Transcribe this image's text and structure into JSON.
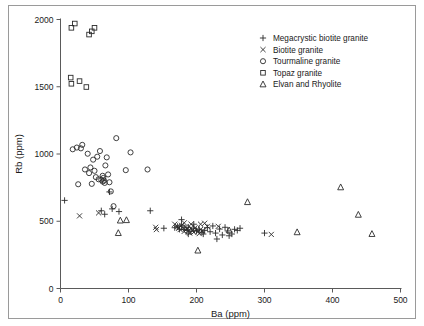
{
  "chart_data": {
    "type": "scatter",
    "title": "",
    "xlabel": "Ba (ppm)",
    "ylabel": "Rb (ppm)",
    "xlim": [
      0,
      500
    ],
    "ylim": [
      0,
      2000
    ],
    "xticks": [
      0,
      100,
      200,
      300,
      400,
      500
    ],
    "yticks": [
      0,
      500,
      1000,
      1500,
      2000
    ],
    "grid": false,
    "legend_position": "top-right",
    "series": [
      {
        "name": "Megacrystic biotite granite",
        "marker": "plus",
        "points": [
          [
            6,
            655
          ],
          [
            72,
            718
          ],
          [
            60,
            578
          ],
          [
            65,
            552
          ],
          [
            76,
            592
          ],
          [
            86,
            572
          ],
          [
            132,
            578
          ],
          [
            152,
            448
          ],
          [
            168,
            452
          ],
          [
            172,
            462
          ],
          [
            175,
            440
          ],
          [
            178,
            470
          ],
          [
            182,
            438
          ],
          [
            186,
            432
          ],
          [
            188,
            455
          ],
          [
            192,
            425
          ],
          [
            196,
            448
          ],
          [
            200,
            430
          ],
          [
            204,
            440
          ],
          [
            208,
            418
          ],
          [
            212,
            432
          ],
          [
            216,
            452
          ],
          [
            220,
            422
          ],
          [
            224,
            465
          ],
          [
            228,
            412
          ],
          [
            230,
            368
          ],
          [
            234,
            442
          ],
          [
            238,
            398
          ],
          [
            242,
            455
          ],
          [
            246,
            428
          ],
          [
            248,
            392
          ],
          [
            252,
            405
          ],
          [
            256,
            440
          ],
          [
            260,
            432
          ],
          [
            264,
            448
          ],
          [
            300,
            412
          ],
          [
            178,
            512
          ],
          [
            196,
            478
          ],
          [
            210,
            405
          ],
          [
            188,
            405
          ]
        ]
      },
      {
        "name": "Biotite granite",
        "marker": "x",
        "points": [
          [
            28,
            540
          ],
          [
            56,
            562
          ],
          [
            140,
            455
          ],
          [
            141,
            438
          ],
          [
            168,
            478
          ],
          [
            172,
            462
          ],
          [
            174,
            448
          ],
          [
            176,
            438
          ],
          [
            178,
            470
          ],
          [
            180,
            452
          ],
          [
            182,
            425
          ],
          [
            184,
            458
          ],
          [
            186,
            442
          ],
          [
            188,
            428
          ],
          [
            190,
            412
          ],
          [
            192,
            448
          ],
          [
            194,
            432
          ],
          [
            196,
            418
          ],
          [
            198,
            452
          ],
          [
            200,
            435
          ],
          [
            202,
            422
          ],
          [
            204,
            408
          ],
          [
            206,
            440
          ],
          [
            208,
            425
          ],
          [
            182,
            488
          ],
          [
            192,
            478
          ],
          [
            206,
            478
          ],
          [
            212,
            485
          ],
          [
            216,
            462
          ],
          [
            232,
            462
          ],
          [
            310,
            402
          ]
        ]
      },
      {
        "name": "Tourmaline granite",
        "marker": "circle",
        "points": [
          [
            18,
            1035
          ],
          [
            24,
            1048
          ],
          [
            26,
            775
          ],
          [
            30,
            1042
          ],
          [
            32,
            1068
          ],
          [
            36,
            885
          ],
          [
            40,
            1002
          ],
          [
            42,
            858
          ],
          [
            44,
            900
          ],
          [
            46,
            778
          ],
          [
            48,
            958
          ],
          [
            52,
            828
          ],
          [
            54,
            980
          ],
          [
            56,
            812
          ],
          [
            58,
            1022
          ],
          [
            60,
            808
          ],
          [
            62,
            795
          ],
          [
            63,
            822
          ],
          [
            64,
            802
          ],
          [
            65,
            785
          ],
          [
            66,
            915
          ],
          [
            68,
            975
          ],
          [
            70,
            848
          ],
          [
            72,
            790
          ],
          [
            74,
            722
          ],
          [
            78,
            612
          ],
          [
            82,
            1118
          ],
          [
            96,
            880
          ],
          [
            103,
            1012
          ],
          [
            128,
            885
          ],
          [
            50,
            875
          ],
          [
            62,
            838
          ]
        ]
      },
      {
        "name": "Topaz granite",
        "marker": "square",
        "points": [
          [
            16,
            1938
          ],
          [
            21,
            1970
          ],
          [
            42,
            1888
          ],
          [
            46,
            1912
          ],
          [
            50,
            1938
          ],
          [
            15,
            1568
          ],
          [
            16,
            1522
          ],
          [
            28,
            1542
          ],
          [
            38,
            1498
          ]
        ]
      },
      {
        "name": "Elvan and Rhyolite",
        "marker": "triangle",
        "points": [
          [
            85,
            412
          ],
          [
            88,
            505
          ],
          [
            97,
            508
          ],
          [
            202,
            282
          ],
          [
            248,
            432
          ],
          [
            275,
            642
          ],
          [
            348,
            418
          ],
          [
            412,
            752
          ],
          [
            438,
            548
          ],
          [
            458,
            405
          ]
        ]
      }
    ]
  },
  "legend": {
    "entries": [
      {
        "label": "Megacrystic biotite granite",
        "marker": "plus"
      },
      {
        "label": "Biotite granite",
        "marker": "x"
      },
      {
        "label": "Tourmaline granite",
        "marker": "circle"
      },
      {
        "label": "Topaz granite",
        "marker": "square"
      },
      {
        "label": "Elvan and Rhyolite",
        "marker": "triangle"
      }
    ]
  },
  "colors": {
    "marker": "#2b2b2b",
    "axis": "#5a5a5a",
    "text": "#1a1a1a",
    "frame": "#9a9a9a",
    "background": "#ffffff"
  }
}
